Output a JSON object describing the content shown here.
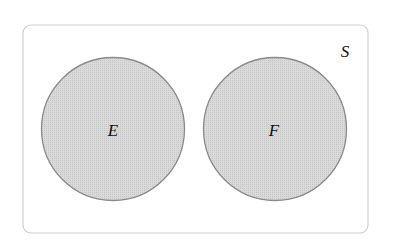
{
  "diagram": {
    "type": "venn",
    "colors": {
      "background": "#ffffff",
      "sample_space_stroke": "#cfcfcf",
      "circle_fill": "#d8d8d8",
      "circle_fill_dot": "#c4c4c4",
      "circle_stroke": "#8a8a8a",
      "label": "#111111"
    },
    "sample_space": {
      "label": "S",
      "x": 23,
      "y": 25,
      "width": 345,
      "height": 208,
      "corner_radius": 8
    },
    "sets": [
      {
        "label": "E",
        "cx": 113,
        "cy": 129,
        "r": 71.5
      },
      {
        "label": "F",
        "cx": 275,
        "cy": 129,
        "r": 71.5
      }
    ],
    "relationship": "disjoint"
  }
}
